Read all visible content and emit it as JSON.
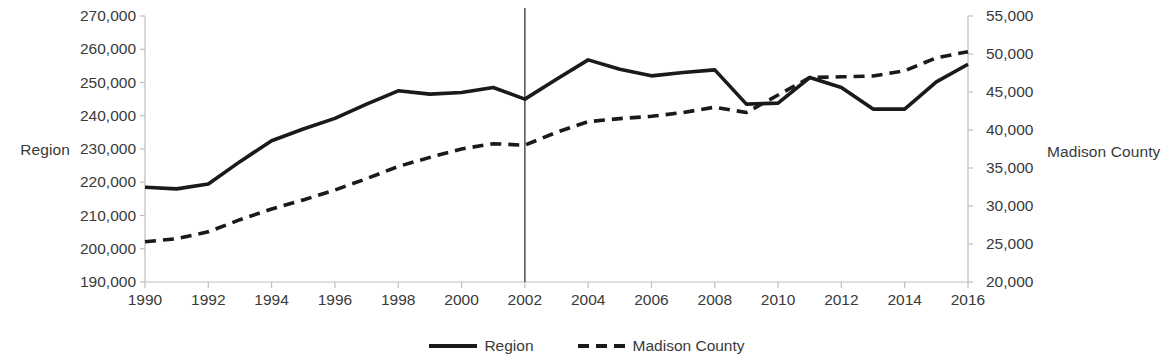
{
  "chart_data": {
    "type": "line",
    "title": "",
    "xlabel": "",
    "ylabel": "Region",
    "y2label": "Madison County",
    "grid": false,
    "legend_position": "bottom",
    "x": [
      1990,
      1991,
      1992,
      1993,
      1994,
      1995,
      1996,
      1997,
      1998,
      1999,
      2000,
      2001,
      2002,
      2003,
      2004,
      2005,
      2006,
      2007,
      2008,
      2009,
      2010,
      2011,
      2012,
      2013,
      2014,
      2015,
      2016
    ],
    "xtick_labels": [
      "1990",
      "1992",
      "1994",
      "1996",
      "1998",
      "2000",
      "2002",
      "2004",
      "2006",
      "2008",
      "2010",
      "2012",
      "2014",
      "2016"
    ],
    "xtick_values": [
      1990,
      1992,
      1994,
      1996,
      1998,
      2000,
      2002,
      2004,
      2006,
      2008,
      2010,
      2012,
      2014,
      2016
    ],
    "xlim": [
      1990,
      2016
    ],
    "ylim": [
      190000,
      270000
    ],
    "y2lim": [
      20000,
      55000
    ],
    "ytick_labels": [
      "270,000",
      "260,000",
      "250,000",
      "240,000",
      "230,000",
      "220,000",
      "210,000",
      "200,000",
      "190,000"
    ],
    "ytick_values": [
      270000,
      260000,
      250000,
      240000,
      230000,
      220000,
      210000,
      200000,
      190000
    ],
    "y2tick_labels": [
      "55,000",
      "50,000",
      "45,000",
      "40,000",
      "35,000",
      "30,000",
      "25,000",
      "20,000"
    ],
    "y2tick_values": [
      55000,
      50000,
      45000,
      40000,
      35000,
      30000,
      25000,
      20000
    ],
    "series": [
      {
        "name": "Region",
        "axis": "left",
        "style": "solid",
        "color": "#1a1a1a",
        "values": [
          218500,
          218000,
          219500,
          226200,
          232500,
          236000,
          239200,
          243500,
          247500,
          246500,
          247000,
          248500,
          245000,
          251000,
          256800,
          254000,
          252000,
          253000,
          253800,
          243500,
          243800,
          251500,
          248500,
          242000,
          242000,
          250200,
          255500
        ]
      },
      {
        "name": "Madison County",
        "axis": "right",
        "style": "dashed",
        "color": "#1a1a1a",
        "values": [
          25300,
          25700,
          26600,
          28200,
          29600,
          30800,
          32100,
          33600,
          35200,
          36400,
          37500,
          38200,
          38000,
          39700,
          41100,
          41500,
          41800,
          42300,
          43000,
          42300,
          44600,
          46900,
          47000,
          47100,
          47800,
          49500,
          50300
        ]
      }
    ],
    "annotations": [
      {
        "type": "vline",
        "x": 2002,
        "color": "#595959"
      }
    ]
  },
  "axes": {
    "left_title": "Region",
    "right_title": "Madison County"
  },
  "legend": {
    "items": [
      {
        "label": "Region",
        "style": "solid"
      },
      {
        "label": "Madison County",
        "style": "dashed"
      }
    ]
  }
}
